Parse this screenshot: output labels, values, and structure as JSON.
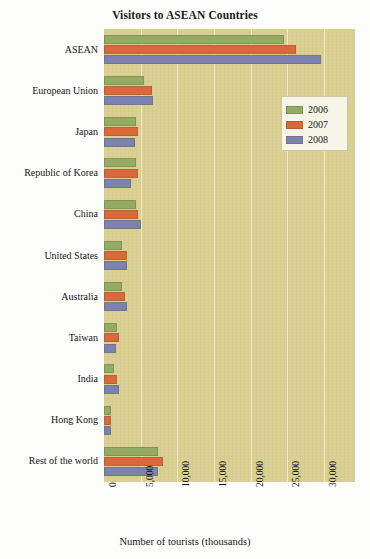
{
  "chart_data": {
    "type": "bar",
    "orientation": "horizontal",
    "title": "Visitors to ASEAN Countries",
    "xlabel": "Number of tourists (thousands)",
    "ylabel": "",
    "xlim": [
      0,
      34200
    ],
    "xticks": [
      0,
      5000,
      10000,
      15000,
      20000,
      25000,
      30000
    ],
    "xtick_labels": [
      "0",
      "5,000",
      "10,000",
      "15,000",
      "20,000",
      "25,000",
      "30,000"
    ],
    "grid": true,
    "legend_position": "upper right",
    "categories": [
      "ASEAN",
      "European Union",
      "Japan",
      "Republic of Korea",
      "China",
      "United States",
      "Australia",
      "Taiwan",
      "India",
      "Hong Kong",
      "Rest of the world"
    ],
    "series": [
      {
        "name": "2006",
        "color": "#93ab62",
        "values": [
          24500,
          5400,
          4300,
          4300,
          4300,
          2500,
          2400,
          1800,
          1400,
          900,
          7300
        ]
      },
      {
        "name": "2007",
        "color": "#d9693a",
        "values": [
          26200,
          6500,
          4600,
          4600,
          4600,
          3100,
          2800,
          2100,
          1800,
          1000,
          8100
        ]
      },
      {
        "name": "2008",
        "color": "#7b82ad",
        "values": [
          29500,
          6700,
          4200,
          3700,
          5100,
          3100,
          3100,
          1700,
          2000,
          900,
          7400
        ]
      }
    ]
  },
  "legend": {
    "entries": [
      {
        "label": "2006",
        "color": "#93ab62"
      },
      {
        "label": "2007",
        "color": "#d9693a"
      },
      {
        "label": "2008",
        "color": "#7b82ad"
      }
    ]
  },
  "colors": {
    "plot_background": "#d9cf91",
    "gridline": "#f2ecca",
    "page_background": "#fdfdfb",
    "text": "#161616"
  }
}
